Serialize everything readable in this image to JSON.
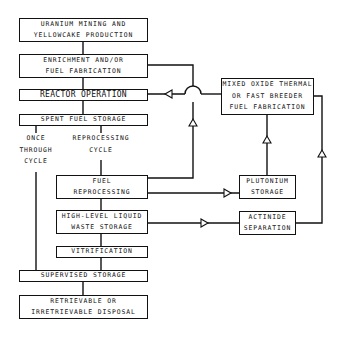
{
  "diagram": {
    "title": "",
    "nodes": [
      {
        "id": "mining",
        "lines": [
          "URANIUM MINING AND",
          "YELLOWCAKE PRODUCTION"
        ]
      },
      {
        "id": "enrichment",
        "lines": [
          "ENRICHMENT AND/OR",
          "FUEL FABRICATION"
        ]
      },
      {
        "id": "reactor",
        "lines": [
          "REACTOR OPERATION"
        ]
      },
      {
        "id": "spent",
        "lines": [
          "SPENT FUEL STORAGE"
        ]
      },
      {
        "id": "reprocessing",
        "lines": [
          "FUEL",
          "REPROCESSING"
        ]
      },
      {
        "id": "hlw",
        "lines": [
          "HIGH-LEVEL LIQUID",
          "WASTE STORAGE"
        ]
      },
      {
        "id": "vitrification",
        "lines": [
          "VITRIFICATION"
        ]
      },
      {
        "id": "supervised",
        "lines": [
          "SUPERVISED STORAGE"
        ]
      },
      {
        "id": "disposal",
        "lines": [
          "RETRIEVABLE OR",
          "IRRETRIEVABLE DISPOSAL"
        ]
      },
      {
        "id": "mox",
        "lines": [
          "MIXED OXIDE THERMAL",
          "OR FAST BREEDER",
          "FUEL FABRICATION"
        ]
      },
      {
        "id": "plutonium",
        "lines": [
          "PLUTONIUM",
          "STORAGE"
        ]
      },
      {
        "id": "actinide",
        "lines": [
          "ACTINIDE",
          "SEPARATION"
        ]
      }
    ],
    "labels": [
      {
        "id": "once_through",
        "lines": [
          "ONCE",
          "THROUGH",
          "CYCLE"
        ]
      },
      {
        "id": "reprocessing_cycle",
        "lines": [
          "REPROCESSING",
          "CYCLE"
        ]
      }
    ],
    "edges": [
      {
        "from": "mining",
        "to": "enrichment"
      },
      {
        "from": "enrichment",
        "to": "reactor"
      },
      {
        "from": "reactor",
        "to": "spent"
      },
      {
        "from": "spent",
        "to": "supervised",
        "via": "once_through"
      },
      {
        "from": "spent",
        "to": "reprocessing",
        "via": "reprocessing_cycle"
      },
      {
        "from": "reprocessing",
        "to": "enrichment",
        "arrow": "up"
      },
      {
        "from": "reprocessing",
        "to": "plutonium",
        "arrow": "right"
      },
      {
        "from": "reprocessing",
        "to": "hlw"
      },
      {
        "from": "hlw",
        "to": "actinide",
        "arrow": "right"
      },
      {
        "from": "hlw",
        "to": "vitrification"
      },
      {
        "from": "vitrification",
        "to": "supervised"
      },
      {
        "from": "supervised",
        "to": "disposal"
      },
      {
        "from": "plutonium",
        "to": "mox",
        "arrow": "up"
      },
      {
        "from": "actinide",
        "to": "mox",
        "arrow": "up"
      },
      {
        "from": "mox",
        "to": "reactor",
        "arrow": "left"
      }
    ]
  }
}
